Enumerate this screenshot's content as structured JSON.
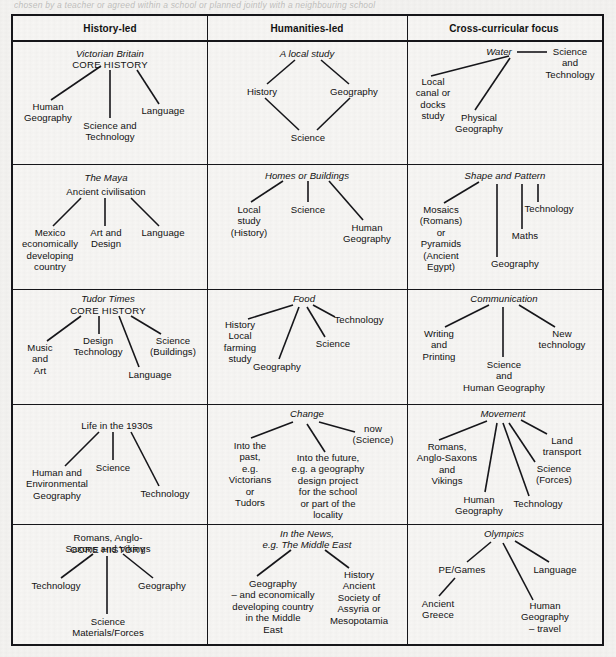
{
  "page": {
    "bleed_top_text": "chosen by a teacher or agreed within a school or planned jointly with a neighbouring school",
    "ink_color": "#16161a",
    "paper_color": "#f4f3f1"
  },
  "table": {
    "headers": [
      {
        "label": "History-led"
      },
      {
        "label": "Humanities-led"
      },
      {
        "label": "Cross-curricular focus"
      }
    ],
    "rows": [
      {
        "cells": [
          {
            "title": "Victorian Britain",
            "subtitle": "CORE HISTORY",
            "branches": [
              "Human\nGeography",
              "Science and\nTechnology",
              "Language"
            ]
          },
          {
            "title": "A local study",
            "branches": [
              "History",
              "Geography",
              "Science"
            ]
          },
          {
            "title": "Water",
            "branches": [
              "Local\ncanal or\ndocks\nstudy",
              "Physical\nGeography",
              "Science\nand\nTechnology"
            ]
          }
        ]
      },
      {
        "cells": [
          {
            "title": "The Maya",
            "subtitle": "Ancient civilisation",
            "branches": [
              "Mexico\neconomically\ndeveloping\ncountry",
              "Art and\nDesign",
              "Language"
            ]
          },
          {
            "title": "Homes or Buildings",
            "branches": [
              "Local\nstudy\n(History)",
              "Science",
              "Human\nGeography"
            ]
          },
          {
            "title": "Shape and Pattern",
            "branches": [
              "Mosaics\n(Romans)\nor\nPyramids\n(Ancient\nEgypt)",
              "Geography",
              "Maths",
              "Technology"
            ]
          }
        ]
      },
      {
        "cells": [
          {
            "title": "Tudor Times",
            "subtitle": "CORE HISTORY",
            "branches": [
              "Music\nand\nArt",
              "Design\nTechnology",
              "Language",
              "Science\n(Buildings)"
            ]
          },
          {
            "title": "Food",
            "branches": [
              "History\nLocal\nfarming\nstudy",
              "Geography",
              "Science",
              "Technology"
            ]
          },
          {
            "title": "Communication",
            "branches": [
              "Writing\nand\nPrinting",
              "Science\nand\nHuman Geography",
              "New\ntechnology"
            ]
          }
        ]
      },
      {
        "cells": [
          {
            "title": "Life in the 1930s",
            "branches": [
              "Human and\nEnvironmental\nGeography",
              "Science",
              "Technology"
            ]
          },
          {
            "title": "Change",
            "branches": [
              "Into the\npast,\ne.g.\nVictorians\nor\nTudors",
              "Into the future,\ne.g. a geography\ndesign project\nfor the school\nor part of the\nlocality",
              "now\n(Science)"
            ]
          },
          {
            "title": "Movement",
            "branches": [
              "Romans,\nAnglo-Saxons\nand\nVikings",
              "Human\nGeography",
              "Technology",
              "Science\n(Forces)",
              "Land\ntransport"
            ]
          }
        ]
      },
      {
        "cells": [
          {
            "title": "Romans, Anglo-Saxons and Vikings",
            "subtitle": "CORE HISTORY",
            "branches": [
              "Technology",
              "Science\nMaterials/Forces",
              "Geography"
            ]
          },
          {
            "title": "In the News,\ne.g. The Middle East",
            "branches": [
              "Geography\n– and economically\ndeveloping country\nin the Middle\nEast",
              "History\nAncient\nSociety of\nAssyria or\nMesopotamia"
            ]
          },
          {
            "title": "Olympics",
            "branches": [
              "PE/Games",
              "Ancient\nGreece",
              "Human\nGeography\n– travel",
              "Language"
            ]
          }
        ]
      }
    ]
  }
}
